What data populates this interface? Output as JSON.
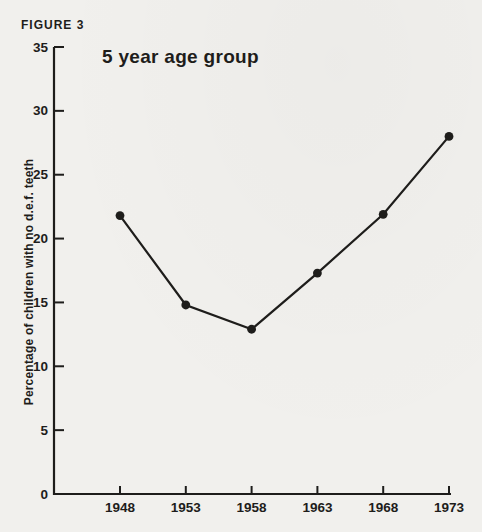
{
  "figure_label": "FIGURE 3",
  "colors": {
    "paper": "#f1f0ed",
    "ink": "#1e1d1b"
  },
  "chart_data": {
    "type": "line",
    "title": "5 year age group",
    "ylabel": "Percentage of children with no d.e.f. teeth",
    "xlabel": "",
    "categories": [
      "1948",
      "1953",
      "1958",
      "1963",
      "1968",
      "1973"
    ],
    "values": [
      21.8,
      14.8,
      12.9,
      17.3,
      21.9,
      28.0
    ],
    "series_name": "Percentage of children with no d.e.f. teeth",
    "ylim": [
      0,
      35
    ],
    "yticks": [
      0,
      5,
      10,
      15,
      20,
      25,
      30,
      35
    ],
    "grid": "off",
    "legend": "none",
    "marker": "filled-circle"
  }
}
